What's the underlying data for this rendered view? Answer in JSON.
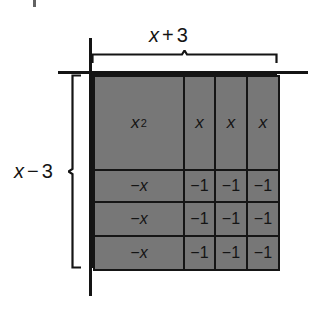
{
  "figure": {
    "colors": {
      "tile_fill": "#777777",
      "line": "#141414",
      "background": "#ffffff"
    },
    "labels": {
      "width": {
        "var": "x",
        "op": "+",
        "num": "3",
        "full": "x + 3"
      },
      "height": {
        "var": "x",
        "op": "−",
        "num": "3",
        "full": "x − 3"
      }
    },
    "grid": {
      "columns": 4,
      "rows": 4,
      "cells": [
        [
          {
            "text": "x",
            "sup": "2",
            "kind": "x-squared"
          },
          {
            "text": "x",
            "sup": "",
            "kind": "x"
          },
          {
            "text": "x",
            "sup": "",
            "kind": "x"
          },
          {
            "text": "x",
            "sup": "",
            "kind": "x"
          }
        ],
        [
          {
            "text": "−x",
            "sup": "",
            "kind": "neg-x"
          },
          {
            "text": "−1",
            "sup": "",
            "kind": "neg-one"
          },
          {
            "text": "−1",
            "sup": "",
            "kind": "neg-one"
          },
          {
            "text": "−1",
            "sup": "",
            "kind": "neg-one"
          }
        ],
        [
          {
            "text": "−x",
            "sup": "",
            "kind": "neg-x"
          },
          {
            "text": "−1",
            "sup": "",
            "kind": "neg-one"
          },
          {
            "text": "−1",
            "sup": "",
            "kind": "neg-one"
          },
          {
            "text": "−1",
            "sup": "",
            "kind": "neg-one"
          }
        ],
        [
          {
            "text": "−x",
            "sup": "",
            "kind": "neg-x"
          },
          {
            "text": "−1",
            "sup": "",
            "kind": "neg-one"
          },
          {
            "text": "−1",
            "sup": "",
            "kind": "neg-one"
          },
          {
            "text": "−1",
            "sup": "",
            "kind": "neg-one"
          }
        ]
      ]
    }
  }
}
